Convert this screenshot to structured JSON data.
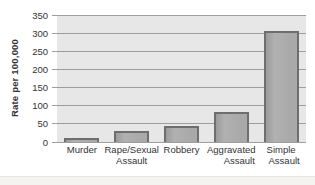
{
  "chart_data": {
    "type": "bar",
    "title": "",
    "xlabel": "",
    "ylabel": "Rate per 100,000",
    "categories": [
      "Murder",
      "Rape/Sexual Assault",
      "Robbery",
      "Aggravated Assault",
      "Simple Assault"
    ],
    "values": [
      6,
      26,
      38,
      77,
      300
    ],
    "x_tick_lines": [
      [
        "Murder"
      ],
      [
        "Rape/Sexual",
        "Assault"
      ],
      [
        "Robbery"
      ],
      [
        "Aggravated",
        "Assault"
      ],
      [
        "Simple",
        "Assault"
      ]
    ],
    "y_ticks": [
      0,
      50,
      100,
      150,
      200,
      250,
      300,
      350
    ],
    "ylim": [
      0,
      350
    ],
    "grid": true,
    "legend": false,
    "colors": {
      "plot_bg": "#e8e7e7",
      "gridline": "#9e9e9e",
      "bar_fill": "#a9a9a9",
      "bar_border": "#6e6e6e",
      "text": "#333333"
    }
  }
}
